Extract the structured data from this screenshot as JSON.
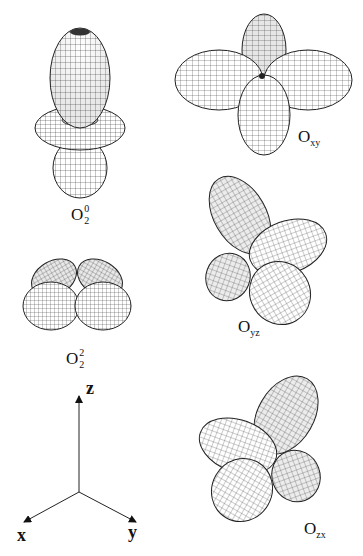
{
  "figure": {
    "panels": [
      {
        "id": "O20",
        "label_base": "O",
        "label_sup": "0",
        "label_sub": "2",
        "shape": "dz2-like: two polar lobes with equatorial torus"
      },
      {
        "id": "Oxy",
        "label_base": "O",
        "label_sub": "xy",
        "shape": "four-lobe clover"
      },
      {
        "id": "Oyz",
        "label_base": "O",
        "label_sub": "yz",
        "shape": "four-lobe clover, tilted"
      },
      {
        "id": "O22",
        "label_base": "O",
        "label_sup": "2",
        "label_sub": "2",
        "shape": "four-lobe flattened butterfly"
      },
      {
        "id": "Ozx",
        "label_base": "O",
        "label_sub": "zx",
        "shape": "four-lobe clover, tilted"
      }
    ],
    "axes": {
      "z": "z",
      "x": "x",
      "y": "y"
    },
    "colors": {
      "wire": "#2a2a2a",
      "fill": "#ffffff",
      "shade": "#cfcfcf"
    }
  }
}
